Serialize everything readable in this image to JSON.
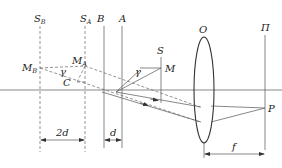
{
  "diagram": {
    "labels": {
      "S_B": {
        "main": "S",
        "sub": "B"
      },
      "S_A": {
        "main": "S",
        "sub": "A"
      },
      "B": "B",
      "A": "A",
      "S": "S",
      "M": "M",
      "M_B": {
        "main": "M",
        "sub": "B"
      },
      "M_A": {
        "main": "M",
        "sub": "A"
      },
      "C": "C",
      "gamma": "γ",
      "O": "O",
      "Pi": "Π",
      "P": "P",
      "dim_2d": "2d",
      "dim_d": "d",
      "dim_f": "f"
    },
    "elements": {
      "optical_axis": "horizontal",
      "planes_dashed": [
        "S_B",
        "S_A"
      ],
      "planes_solid": [
        "B",
        "A",
        "S",
        "Π"
      ],
      "lens": "O (biconvex)",
      "focus_point": "P"
    },
    "colors": {
      "line": "#555555",
      "lens": "#333333",
      "text": "#222222",
      "background": "#ffffff"
    }
  }
}
